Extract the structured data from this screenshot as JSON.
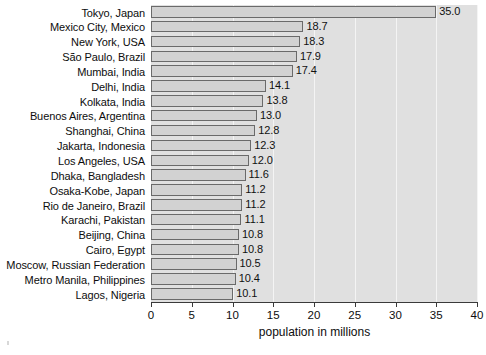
{
  "chart_data": {
    "type": "bar",
    "orientation": "horizontal",
    "title": "",
    "xlabel": "population in millions",
    "ylabel": "",
    "xlim": [
      0,
      40
    ],
    "xticks": [
      0,
      5,
      10,
      15,
      20,
      25,
      30,
      35,
      40
    ],
    "grid": true,
    "grid_axis": "x",
    "legend": false,
    "value_labels": true,
    "categories": [
      "Tokyo, Japan",
      "Mexico City, Mexico",
      "New York, USA",
      "São Paulo, Brazil",
      "Mumbai, India",
      "Delhi, India",
      "Kolkata, India",
      "Buenos Aires, Argentina",
      "Shanghai, China",
      "Jakarta, Indonesia",
      "Los Angeles, USA",
      "Dhaka, Bangladesh",
      "Osaka-Kobe, Japan",
      "Rio de Janeiro, Brazil",
      "Karachi, Pakistan",
      "Beijing, China",
      "Cairo, Egypt",
      "Moscow, Russian Federation",
      "Metro Manila, Philippines",
      "Lagos, Nigeria"
    ],
    "values": [
      35.0,
      18.7,
      18.3,
      17.9,
      17.4,
      14.1,
      13.8,
      13.0,
      12.8,
      12.3,
      12.0,
      11.6,
      11.2,
      11.2,
      11.1,
      10.8,
      10.8,
      10.5,
      10.4,
      10.1
    ],
    "value_labels_text": [
      "35.0",
      "18.7",
      "18.3",
      "17.9",
      "17.4",
      "14.1",
      "13.8",
      "13.0",
      "12.8",
      "12.3",
      "12.0",
      "11.6",
      "11.2",
      "11.2",
      "11.1",
      "10.8",
      "10.8",
      "10.5",
      "10.4",
      "10.1"
    ],
    "xtick_labels": [
      "0",
      "5",
      "10",
      "15",
      "20",
      "25",
      "30",
      "35",
      "40"
    ]
  },
  "style": {
    "plot_background": "#e0e0e0",
    "page_background": "#ffffff",
    "bar_fill": "#d2d2d2",
    "bar_border": "#6a6a6a",
    "gridline_color": "#f4f4f4",
    "axis_color": "#3a3a3a",
    "text_color": "#0d0d0d"
  }
}
